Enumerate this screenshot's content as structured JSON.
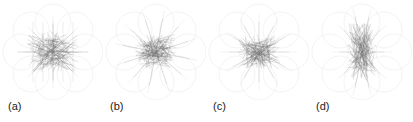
{
  "figure": {
    "panels": [
      {
        "id": "a",
        "label": "(a)",
        "style": "grid-symmetric"
      },
      {
        "id": "b",
        "label": "(b)",
        "style": "star-radial"
      },
      {
        "id": "c",
        "label": "(c)",
        "style": "star-dense"
      },
      {
        "id": "d",
        "label": "(d)",
        "style": "elongated-vertical"
      }
    ],
    "colors": {
      "edge": "#9a9a9a",
      "faint": "#dddddd",
      "dense": "#555555"
    }
  }
}
